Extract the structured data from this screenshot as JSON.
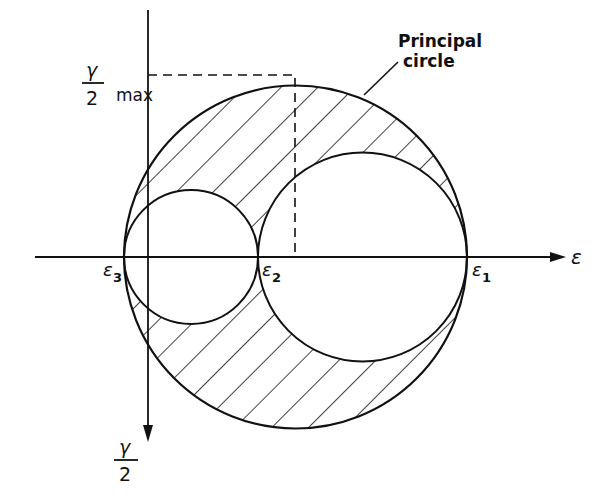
{
  "diagram": {
    "axes": {
      "horizontal_label": "ε",
      "vertical_label_numerator": "γ",
      "vertical_label_denominator": "2"
    },
    "points": [
      {
        "id": "e3",
        "symbol": "ε",
        "subscript": "3"
      },
      {
        "id": "e2",
        "symbol": "ε",
        "subscript": "2"
      },
      {
        "id": "e1",
        "symbol": "ε",
        "subscript": "1"
      }
    ],
    "max_label": {
      "numerator": "γ",
      "denominator": "2",
      "suffix": "max"
    },
    "annotation": {
      "line1": "Principal",
      "line2": "circle"
    },
    "colors": {
      "ink": "#111111",
      "background": "#ffffff"
    }
  }
}
